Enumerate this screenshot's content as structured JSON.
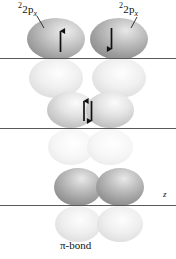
{
  "figure": {
    "title_text": "π-bond",
    "background_color": "#ffffff",
    "axis_color": "#555555",
    "arrow_color": "#111111",
    "labels": {
      "orbital_left": {
        "base": "2p",
        "superscript": "2",
        "subscript": "x",
        "full": "2p_x"
      },
      "orbital_right": {
        "base": "2p",
        "superscript": "2",
        "subscript": "x",
        "full": "2p_x"
      },
      "axis_z": "z",
      "bond_caption": "π-bond"
    },
    "spins": {
      "left_up": "↑",
      "right_down": "↓",
      "paired_up": "↑",
      "paired_down": "↓"
    },
    "rows": [
      {
        "name": "separated-orbitals",
        "description": "two separate 2p_x orbitals with opposite spins",
        "lobe_upper_color": "#a8a8a8",
        "lobe_lower_color": "#e6e6e6"
      },
      {
        "name": "overlapping-orbitals",
        "description": "two overlapping 2p_x orbitals with paired spins",
        "lobe_upper_color": "#cfcfcf",
        "lobe_lower_color": "#efefef"
      },
      {
        "name": "pi-bond-formed",
        "description": "resulting pi bond with merged electron density",
        "lobe_upper_color": "#9f9f9f",
        "lobe_lower_color": "#e4e4e4"
      }
    ]
  }
}
